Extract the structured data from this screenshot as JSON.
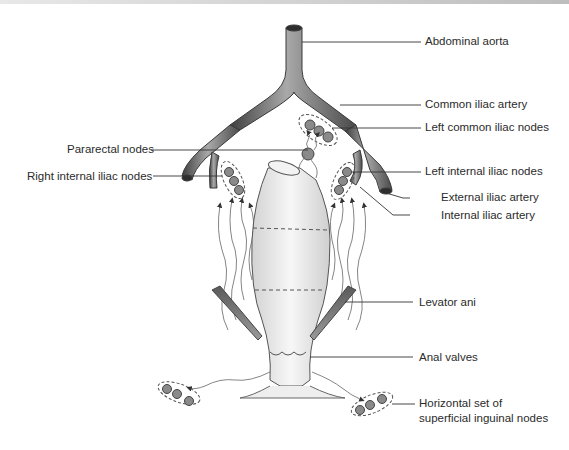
{
  "figure": {
    "labels": {
      "abdominal_aorta": "Abdominal aorta",
      "common_iliac_artery": "Common iliac artery",
      "left_common_iliac_nodes": "Left common iliac nodes",
      "pararectal_nodes": "Pararectal nodes",
      "right_internal_iliac_nodes": "Right internal iliac nodes",
      "left_internal_iliac_nodes": "Left internal iliac nodes",
      "external_iliac_artery": "External iliac artery",
      "internal_iliac_artery": "Internal iliac artery",
      "levator_ani": "Levator ani",
      "anal_valves": "Anal valves",
      "inguinal_nodes_line1": "Horizontal set of",
      "inguinal_nodes_line2": "superficial inguinal nodes"
    },
    "colors": {
      "artery": "#6f6f6f",
      "node_fill": "#8a8a8a",
      "leader_line": "#333333",
      "rectum_fill": "#ececec",
      "lymph_vessel": "#7a7a7a"
    }
  }
}
